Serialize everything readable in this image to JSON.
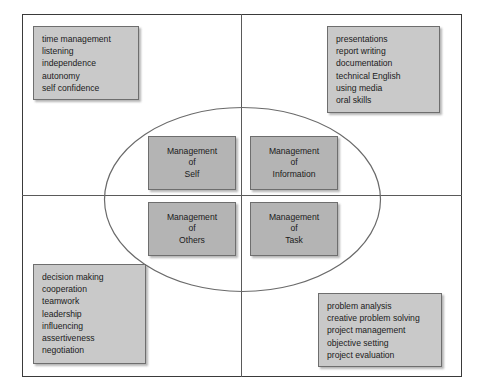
{
  "diagram": {
    "colors": {
      "frame_border": "#3a3a3a",
      "axis_line": "#5a5a5a",
      "ellipse_stroke": "#6a6a6a",
      "list_box_fill": "#c9c9c9",
      "core_box_fill": "#b4b4b4",
      "box_border": "#6e6e6e",
      "text": "#1b1b1b",
      "background": "#ffffff"
    },
    "core": {
      "self": {
        "lines": [
          "Management",
          "of",
          "Self"
        ]
      },
      "information": {
        "lines": [
          "Management",
          "of",
          "Information"
        ]
      },
      "others": {
        "lines": [
          "Management",
          "of",
          "Others"
        ]
      },
      "task": {
        "lines": [
          "Management",
          "of",
          "Task"
        ]
      }
    },
    "quadrants": {
      "top_left": {
        "label": "Management of Self skills",
        "items": [
          "time management",
          "listening",
          "independence",
          "autonomy",
          "self confidence"
        ]
      },
      "top_right": {
        "label": "Management of Information skills",
        "items": [
          "presentations",
          "report writing",
          "documentation",
          "technical English",
          "using media",
          "oral skills"
        ]
      },
      "bottom_left": {
        "label": "Management of Others skills",
        "items": [
          "decision making",
          "cooperation",
          "teamwork",
          "leadership",
          "influencing",
          "assertiveness",
          "negotiation"
        ]
      },
      "bottom_right": {
        "label": "Management of Task skills",
        "items": [
          "problem analysis",
          "creative problem solving",
          "project management",
          "objective setting",
          "project evaluation"
        ]
      }
    }
  }
}
